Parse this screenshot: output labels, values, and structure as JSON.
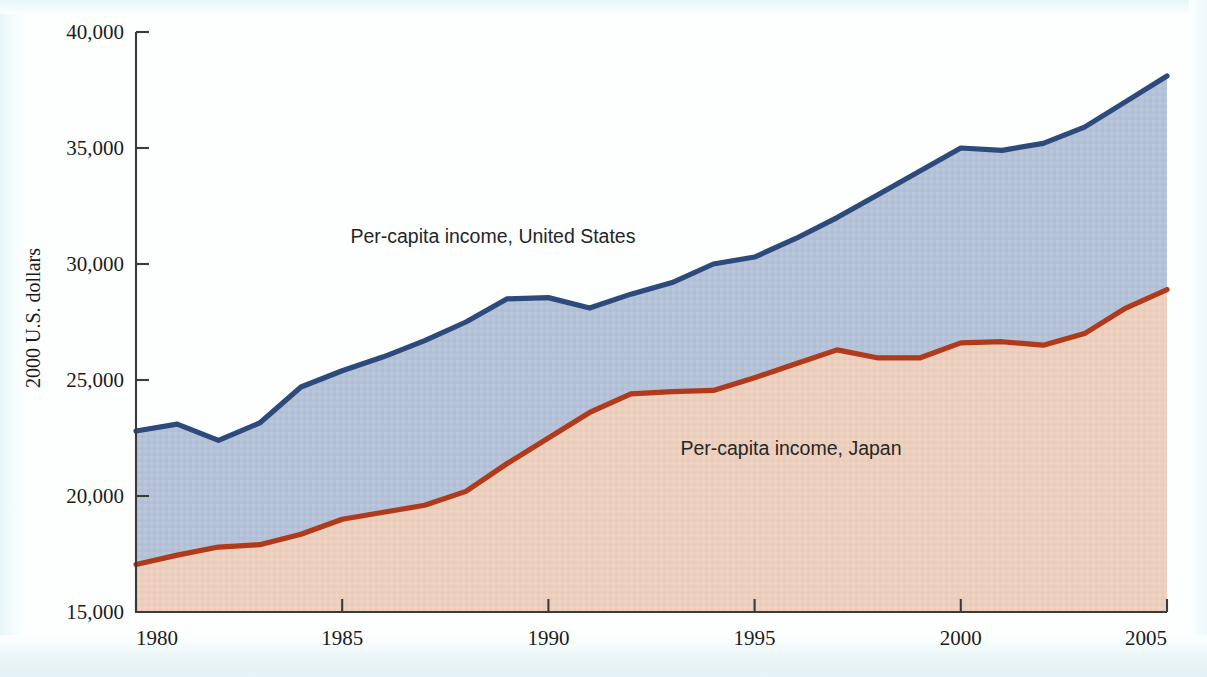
{
  "figure": {
    "background_color": "#fdffff",
    "frame_color": "#3b3b3b"
  },
  "axes": {
    "y_title": "2000 U.S. dollars",
    "y_ticks": [
      "15,000",
      "20,000",
      "25,000",
      "30,000",
      "35,000",
      "40,000"
    ],
    "x_ticks": [
      "1980",
      "1985",
      "1990",
      "1995",
      "2000",
      "2005"
    ]
  },
  "annotations": {
    "us_label": "Per-capita income, United States",
    "japan_label": "Per-capita income, Japan"
  },
  "colors": {
    "us_line": "#2d4a7c",
    "us_fill": "#b4c2d8",
    "japan_line": "#b03a1a",
    "japan_fill": "#eccfbd",
    "axis": "#3b3b3b",
    "text": "#1b1b1b"
  },
  "chart_data": {
    "type": "area",
    "title": "",
    "xlabel": "",
    "ylabel": "2000 U.S. dollars",
    "xlim": [
      1980,
      2005
    ],
    "ylim": [
      15000,
      40000
    ],
    "ytick_values": [
      15000,
      20000,
      25000,
      30000,
      35000,
      40000
    ],
    "xtick_values": [
      1980,
      1985,
      1990,
      1995,
      2000,
      2005
    ],
    "grid": false,
    "legend": "inline-annotations",
    "x": [
      1980,
      1981,
      1982,
      1983,
      1984,
      1985,
      1986,
      1987,
      1988,
      1989,
      1990,
      1991,
      1992,
      1993,
      1994,
      1995,
      1996,
      1997,
      1998,
      1999,
      2000,
      2001,
      2002,
      2003,
      2004,
      2005
    ],
    "series": [
      {
        "name": "Per-capita income, United States",
        "line_color": "#2d4a7c",
        "fill_color": "#b4c2d8",
        "values": [
          22800,
          23100,
          22400,
          23150,
          24700,
          25400,
          26000,
          26700,
          27500,
          28500,
          28550,
          28100,
          28700,
          29200,
          30000,
          30300,
          31100,
          32000,
          33000,
          34000,
          35000,
          34900,
          35200,
          35900,
          37000,
          38100
        ]
      },
      {
        "name": "Per-capita income, Japan",
        "line_color": "#b03a1a",
        "fill_color": "#eccfbd",
        "values": [
          17050,
          17450,
          17800,
          17900,
          18350,
          19000,
          19300,
          19600,
          20200,
          21400,
          22500,
          23600,
          24400,
          24500,
          24550,
          25100,
          25700,
          26300,
          25950,
          25950,
          26600,
          26650,
          26500,
          27000,
          28100,
          28900
        ]
      }
    ],
    "annotations": [
      {
        "text": "Per-capita income, United States",
        "x": 1985.2,
        "y": 30900
      },
      {
        "text": "Per-capita income, Japan",
        "x": 1993.2,
        "y": 21750
      }
    ]
  }
}
